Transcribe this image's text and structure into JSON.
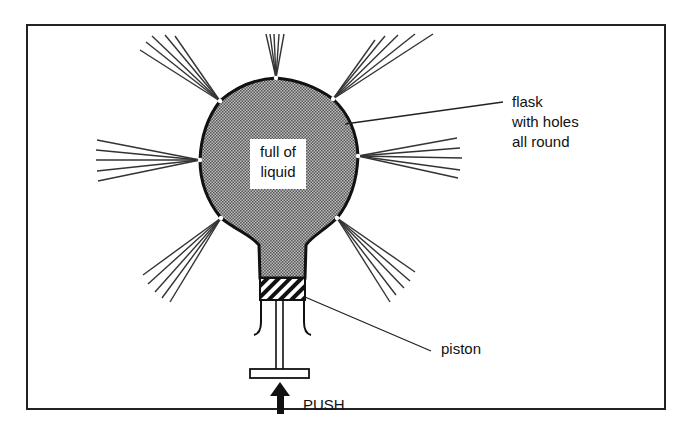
{
  "diagram": {
    "type": "physics-illustration",
    "labels": {
      "flask": [
        "flask",
        "with holes",
        "all round"
      ],
      "liquid": [
        "full of",
        "liquid"
      ],
      "piston": "piston",
      "push": "PUSH"
    },
    "components": [
      {
        "id": "flask",
        "shape": "spherical flask with neck",
        "fill": "stippled grey"
      },
      {
        "id": "holes",
        "count": 8,
        "description": "jets of liquid spraying radially out of holes around the flask"
      },
      {
        "id": "piston",
        "description": "hatched piston inside the neck"
      },
      {
        "id": "plunger",
        "description": "rod with T-handle below piston"
      },
      {
        "id": "push-arrow",
        "direction": "up"
      }
    ],
    "colors": {
      "ink": "#111111",
      "liquid_fill": "#9a9a9a",
      "background": "#ffffff"
    }
  }
}
